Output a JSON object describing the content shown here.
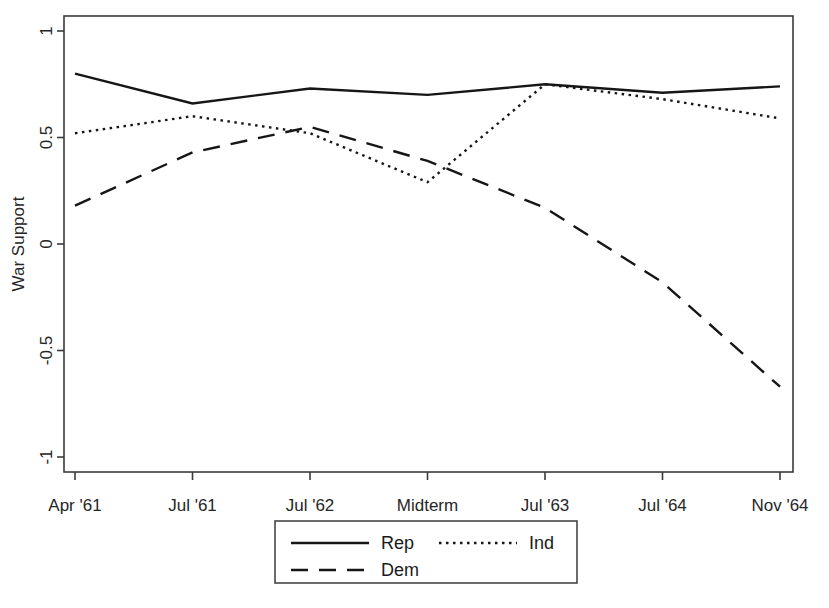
{
  "chart_data": {
    "type": "line",
    "title": "",
    "xlabel": "",
    "ylabel": "War Support",
    "categories": [
      "Apr '61",
      "Jul '61",
      "Jul '62",
      "Midterm",
      "Jul '63",
      "Jul '64",
      "Nov '64"
    ],
    "ylim": [
      -1,
      1
    ],
    "yticks": [
      1,
      0.5,
      0,
      -0.5,
      -1
    ],
    "ytick_labels": [
      "1",
      "0.5",
      "0",
      "-0.5",
      "-1"
    ],
    "grid": false,
    "legend_position": "bottom-center",
    "series": [
      {
        "name": "Rep",
        "style": "solid",
        "color": "#161616",
        "values": [
          0.8,
          0.66,
          0.73,
          0.7,
          0.75,
          0.71,
          0.74
        ]
      },
      {
        "name": "Ind",
        "style": "dotted",
        "color": "#161616",
        "values": [
          0.52,
          0.6,
          0.52,
          0.29,
          0.75,
          0.68,
          0.59
        ]
      },
      {
        "name": "Dem",
        "style": "dashed",
        "color": "#161616",
        "values": [
          0.18,
          0.43,
          0.55,
          0.39,
          0.17,
          -0.18,
          -0.67
        ]
      }
    ]
  },
  "axis": {
    "y_title": "War Support",
    "y_tick_labels": [
      "1",
      "0.5",
      "0",
      "-0.5",
      "-1"
    ],
    "x_tick_labels": [
      "Apr '61",
      "Jul '61",
      "Jul '62",
      "Midterm",
      "Jul '63",
      "Jul '64",
      "Nov '64"
    ]
  },
  "legend": {
    "entries": [
      {
        "label": "Rep",
        "style": "solid"
      },
      {
        "label": "Ind",
        "style": "dotted"
      },
      {
        "label": "Dem",
        "style": "dashed"
      }
    ]
  }
}
